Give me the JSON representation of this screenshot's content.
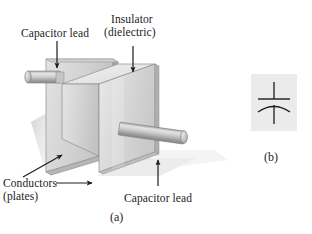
{
  "figure": {
    "title_absent": true,
    "panels": [
      {
        "id": "a",
        "caption": "(a)"
      },
      {
        "id": "b",
        "caption": "(b)"
      }
    ]
  },
  "labels": {
    "capacitor_lead_top": "Capacitor lead",
    "insulator_line1": "Insulator",
    "insulator_line2": "(dielectric)",
    "conductors_line1": "Conductors",
    "conductors_line2": "(plates)",
    "capacitor_lead_bottom": "Capacitor lead"
  },
  "captions": {
    "panel_a": "(a)",
    "panel_b": "(b)"
  },
  "colors": {
    "background": "#ffffff",
    "text": "#1c1c1c",
    "plate_face_light": "#dcdcdc",
    "plate_face_mid": "#c0c0c0",
    "plate_edge_dark": "#9a9a9a",
    "dielectric_top": "#e8e8e8",
    "dielectric_front": "#cfcfcf",
    "dielectric_side": "#bdbdbd",
    "lead_light": "#e2e2e2",
    "lead_mid": "#b4b4b4",
    "lead_dark": "#8e8e8e",
    "shadow": "#d9d9d9",
    "symbol_panel_bg": "#ebebeb",
    "stroke": "#4a4a4a"
  },
  "symbol": {
    "name": "capacitor-symbol",
    "type": "polarized-capacitor",
    "parts": [
      "top-lead-line",
      "straight-plate",
      "curved-plate",
      "bottom-lead-line"
    ]
  },
  "annotations": [
    {
      "name": "arrow-capacitor-lead-top",
      "direction": "down",
      "target": "left-capacitor-lead"
    },
    {
      "name": "arrow-insulator",
      "direction": "down",
      "target": "dielectric-block"
    },
    {
      "name": "arrow-conductors-diagonal",
      "direction": "up-right",
      "target": "back-plate-edge"
    },
    {
      "name": "arrow-conductors-horizontal",
      "direction": "right",
      "target": "back-plate-bottom"
    },
    {
      "name": "arrow-capacitor-lead-bottom",
      "direction": "up",
      "target": "right-capacitor-lead"
    }
  ]
}
